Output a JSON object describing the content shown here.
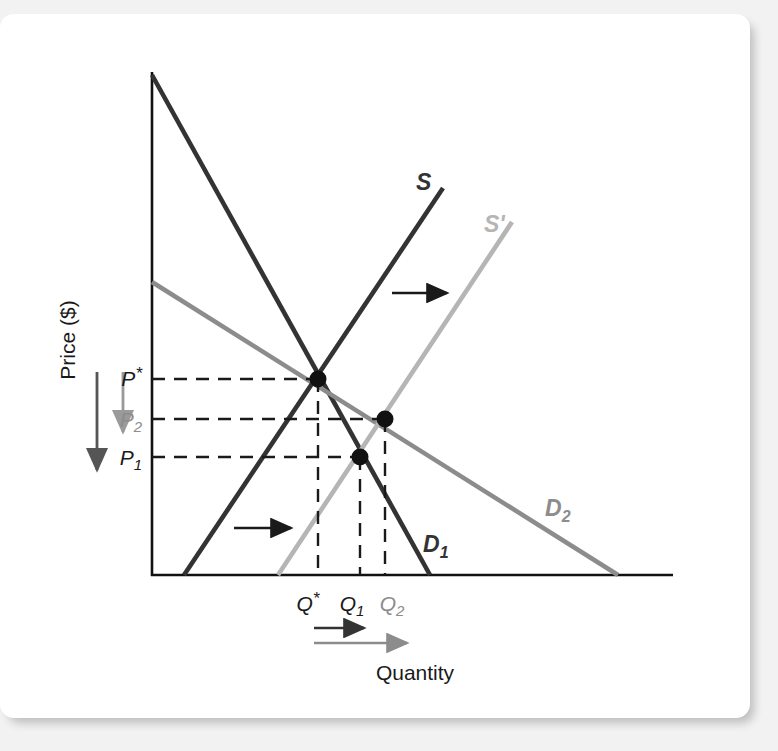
{
  "figure": {
    "axes": {
      "y_label": "Price ($)",
      "x_label": "Quantity"
    },
    "price_ticks": [
      {
        "id": "p-star",
        "label": "P",
        "sup": "*",
        "sub": "",
        "color": "#1a1a1a",
        "y": 379
      },
      {
        "id": "p-2",
        "label": "P",
        "sup": "",
        "sub": "2",
        "color": "#8c8c8c",
        "y": 419
      },
      {
        "id": "p-1",
        "label": "P",
        "sup": "",
        "sub": "1",
        "color": "#1a1a1a",
        "y": 457
      }
    ],
    "quantity_ticks": [
      {
        "id": "q-star",
        "label": "Q",
        "sup": "*",
        "sub": "",
        "color": "#1a1a1a",
        "x": 318
      },
      {
        "id": "q-1",
        "label": "Q",
        "sup": "",
        "sub": "1",
        "color": "#1a1a1a",
        "x": 360
      },
      {
        "id": "q-2",
        "label": "Q",
        "sup": "",
        "sub": "2",
        "color": "#8c8c8c",
        "x": 385
      }
    ],
    "curve_labels": [
      {
        "id": "supply-original",
        "text": "S",
        "color": "#333333",
        "x": 416,
        "y": 190
      },
      {
        "id": "supply-shifted",
        "text": "S'",
        "color": "#b5b5b5",
        "x": 487,
        "y": 230
      },
      {
        "id": "demand-original",
        "text": "D",
        "sub": "1",
        "color": "#333333",
        "x": 429,
        "y": 552
      },
      {
        "id": "demand-shifted",
        "text": "D",
        "sub": "2",
        "color": "#8c8c8c",
        "x": 549,
        "y": 516
      }
    ],
    "equilibrium_points": [
      {
        "id": "eq-original",
        "price": "P*",
        "quantity": "Q*",
        "x": 318,
        "y": 379
      },
      {
        "id": "eq-demand-shift",
        "price": "P2",
        "quantity": "Q2",
        "x": 385,
        "y": 419
      },
      {
        "id": "eq-supply-shift",
        "price": "P1",
        "quantity": "Q1",
        "x": 360,
        "y": 457
      }
    ],
    "shift_arrows": [
      {
        "id": "supply-shift-arrow-upper",
        "direction": "right",
        "color": "#1a1a1a"
      },
      {
        "id": "supply-shift-arrow-lower",
        "direction": "right",
        "color": "#1a1a1a"
      },
      {
        "id": "price-drop-arrow-long",
        "direction": "down",
        "color": "#555555"
      },
      {
        "id": "price-drop-arrow-short",
        "direction": "down",
        "color": "#9a9a9a"
      },
      {
        "id": "quantity-rise-arrow-dark",
        "direction": "right",
        "color": "#333333"
      },
      {
        "id": "quantity-rise-arrow-gray",
        "direction": "right",
        "color": "#8c8c8c"
      }
    ],
    "colors": {
      "dark": "#333333",
      "mid_gray": "#8c8c8c",
      "light_gray": "#b5b5b5",
      "axis": "#111111",
      "dash": "#1a1a1a"
    }
  }
}
